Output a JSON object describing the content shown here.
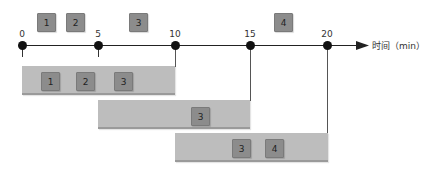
{
  "axis": {
    "label": "时间（min）",
    "ticks": [
      {
        "value": "0",
        "x": 22
      },
      {
        "value": "5",
        "x": 98
      },
      {
        "value": "10",
        "x": 175
      },
      {
        "value": "15",
        "x": 250
      },
      {
        "value": "20",
        "x": 327
      }
    ]
  },
  "arrivals": [
    {
      "id": "1",
      "x": 37
    },
    {
      "id": "2",
      "x": 66
    },
    {
      "id": "3",
      "x": 129
    },
    {
      "id": "4",
      "x": 274
    }
  ],
  "batches": [
    {
      "start": 22,
      "end": 175,
      "top": 66,
      "items": [
        {
          "id": "1",
          "x": 41
        },
        {
          "id": "2",
          "x": 76
        },
        {
          "id": "3",
          "x": 114
        }
      ]
    },
    {
      "start": 98,
      "end": 250,
      "top": 100,
      "items": [
        {
          "id": "3",
          "x": 191
        }
      ]
    },
    {
      "start": 175,
      "end": 328,
      "top": 133,
      "items": [
        {
          "id": "3",
          "x": 232
        },
        {
          "id": "4",
          "x": 265
        }
      ]
    }
  ],
  "colors": {
    "chip": "#8c8c8c",
    "bar": "#bdbdbd",
    "axis": "#222222"
  }
}
